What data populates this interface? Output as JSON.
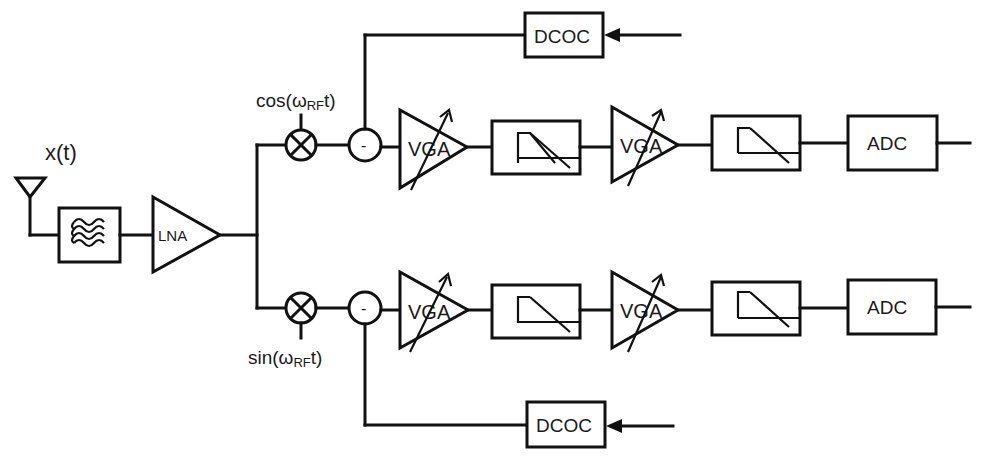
{
  "diagram": {
    "type": "block-diagram",
    "input_label": "x(t)",
    "front_end": {
      "antenna": "antenna-icon",
      "filter": "band-pass filter",
      "lna_label": "LNA"
    },
    "branches": [
      {
        "id": "I",
        "lo_label": "cos(ωRFt)",
        "lo_prefix": "cos(ω",
        "lo_sub": "RF",
        "lo_suffix": "t)",
        "subtractor_label": "-",
        "vga1_label": "VGA",
        "vga2_label": "VGA",
        "adc_label": "ADC",
        "dcoc_label": "DCOC"
      },
      {
        "id": "Q",
        "lo_label": "sin(ωRFt)",
        "lo_prefix": "sin(ω",
        "lo_sub": "RF",
        "lo_suffix": "t)",
        "subtractor_label": "-",
        "vga1_label": "VGA",
        "vga2_label": "VGA",
        "adc_label": "ADC",
        "dcoc_label": "DCOC"
      }
    ],
    "colors": {
      "line": "#111111",
      "background": "#ffffff"
    }
  }
}
